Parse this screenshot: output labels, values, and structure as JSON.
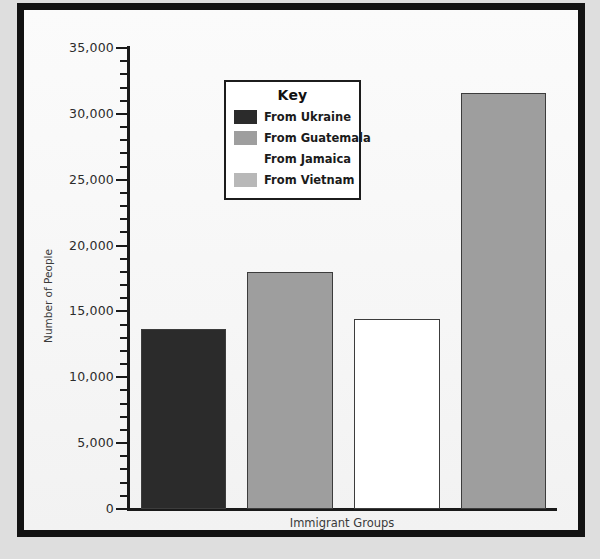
{
  "figure": {
    "background_color": "#dedede",
    "plot_background_color": "#f8f8f8",
    "frame_color": "#121212"
  },
  "legend": {
    "title": "Key",
    "position": "inside-upper-left",
    "entries": [
      {
        "label": "From Ukraine",
        "color": "#2b2b2b",
        "border": "#2b2b2b"
      },
      {
        "label": "From Guatemala",
        "color": "#9e9e9e",
        "border": "#9e9e9e"
      },
      {
        "label": "From Jamaica",
        "color": "#ffffff",
        "border": "#ffffff"
      },
      {
        "label": "From Vietnam",
        "color": "#b8b8b8",
        "border": "#b8b8b8"
      }
    ]
  },
  "chart_data": {
    "type": "bar",
    "title": "",
    "xlabel": "Immigrant Groups",
    "ylabel": "Number of People",
    "categories": [
      "From Ukraine",
      "From Guatemala",
      "From Jamaica",
      "From Vietnam"
    ],
    "values": [
      13700,
      18000,
      14400,
      31600
    ],
    "colors": [
      "#2b2b2b",
      "#9e9e9e",
      "#ffffff",
      "#9e9e9e"
    ],
    "bar_edge_color": "#3c3c3c",
    "ylim": [
      0,
      35000
    ],
    "xlim_note": "no category tick labels drawn on x-axis",
    "ytick_major_step": 5000,
    "ytick_minor_step": 1000,
    "ytick_labels": [
      "0",
      "5,000",
      "10,000",
      "15,000",
      "20,000",
      "25,000",
      "30,000",
      "35,000"
    ],
    "ytick_values": [
      0,
      5000,
      10000,
      15000,
      20000,
      25000,
      30000,
      35000
    ],
    "grid": false,
    "legend_position": "inside-upper-left"
  }
}
